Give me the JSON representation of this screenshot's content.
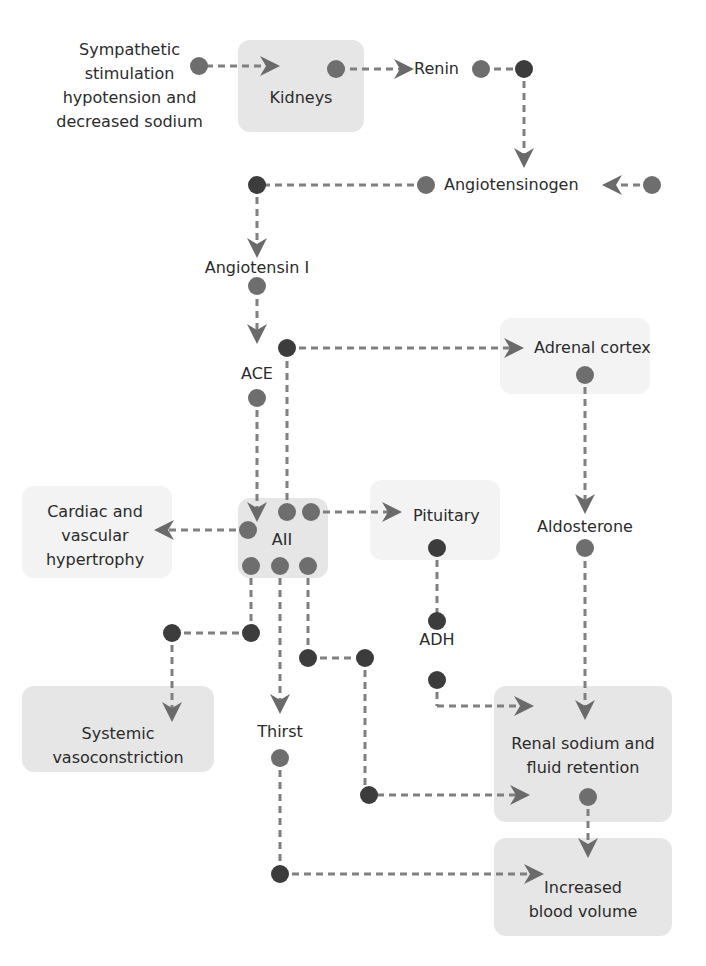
{
  "colors": {
    "node_gray": "#6e6e6e",
    "node_dark": "#3c3c3c",
    "line": "#7a7a7a",
    "arrow": "#6a6a6a",
    "box": "#e6e6e6",
    "box_faint": "#f3f3f3"
  },
  "nodes": {
    "sympathetic": {
      "line1": "Sympathetic",
      "line2": "stimulation",
      "line3": "hypotension and",
      "line4": "decreased sodium"
    },
    "kidneys": {
      "label": "Kidneys"
    },
    "renin": {
      "label": "Renin"
    },
    "angiotensinogen": {
      "label": "Angiotensinogen"
    },
    "angiotensin_i": {
      "label": "Angiotensin I"
    },
    "ace": {
      "label": "ACE"
    },
    "adrenal_cortex": {
      "label": "Adrenal cortex"
    },
    "aii": {
      "label": "AII"
    },
    "cardiac": {
      "line1": "Cardiac and",
      "line2": "vascular",
      "line3": "hypertrophy"
    },
    "pituitary": {
      "label": "Pituitary"
    },
    "aldosterone": {
      "label": "Aldosterone"
    },
    "adh": {
      "label": "ADH"
    },
    "systemic": {
      "line1": "Systemic",
      "line2": "vasoconstriction"
    },
    "thirst": {
      "label": "Thirst"
    },
    "renal": {
      "line1": "Renal sodium and",
      "line2": "fluid retention"
    },
    "blood_volume": {
      "line1": "Increased",
      "line2": "blood volume"
    }
  }
}
